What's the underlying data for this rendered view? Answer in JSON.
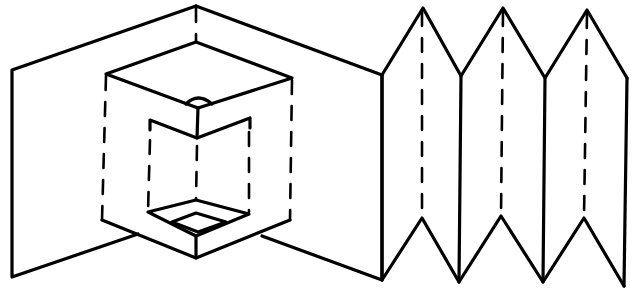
{
  "diagram": {
    "stroke_color": "#000000",
    "background": "#ffffff",
    "parts": [
      {
        "name": "pop-up card",
        "features": [
          "two card panels meeting at a center valley fold",
          "pop-up cube with top face",
          "inner recessed box with dashed fold lines",
          "small semicircular notch on cube top"
        ]
      },
      {
        "name": "accordion fold",
        "features": [
          "four vertical panels",
          "zigzag top and bottom edges",
          "three dashed center fold lines"
        ]
      }
    ]
  }
}
